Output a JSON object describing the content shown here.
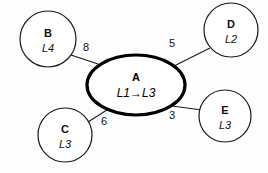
{
  "diagram": {
    "type": "node-link-graph",
    "background_color": "#fdfdfd",
    "stroke_color": "#1a1a1a",
    "center_node": {
      "id": "A",
      "label": "A",
      "sublabel": "L1→L3",
      "shape": "ellipse",
      "emphasis": "thick-border",
      "cx": 136,
      "cy": 85,
      "rx": 49,
      "ry": 30
    },
    "nodes": [
      {
        "id": "B",
        "label": "B",
        "sublabel": "L4",
        "shape": "circle",
        "cx": 48,
        "cy": 39,
        "r": 28
      },
      {
        "id": "D",
        "label": "D",
        "sublabel": "L2",
        "shape": "circle",
        "cx": 231,
        "cy": 30,
        "r": 27
      },
      {
        "id": "C",
        "label": "C",
        "sublabel": "L3",
        "shape": "circle",
        "cx": 65,
        "cy": 135,
        "r": 27
      },
      {
        "id": "E",
        "label": "E",
        "sublabel": "L3",
        "shape": "circle",
        "cx": 225,
        "cy": 116,
        "r": 26
      }
    ],
    "edges": [
      {
        "from": "B",
        "to": "A",
        "weight": "8",
        "x1": 71,
        "y1": 55,
        "x2": 98,
        "y2": 64,
        "label_x": 86,
        "label_y": 48
      },
      {
        "from": "A",
        "to": "D",
        "weight": "5",
        "x1": 174,
        "y1": 66,
        "x2": 210,
        "y2": 48,
        "label_x": 172,
        "label_y": 44
      },
      {
        "from": "C",
        "to": "A",
        "weight": "6",
        "x1": 88,
        "y1": 122,
        "x2": 109,
        "y2": 108,
        "label_x": 104,
        "label_y": 122
      },
      {
        "from": "A",
        "to": "E",
        "weight": "3",
        "x1": 172,
        "y1": 106,
        "x2": 202,
        "y2": 110,
        "label_x": 172,
        "label_y": 116
      }
    ]
  }
}
